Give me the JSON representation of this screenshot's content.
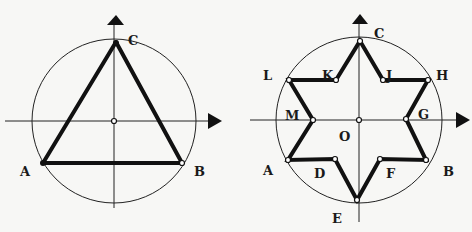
{
  "figures": [
    {
      "name": "triangle-in-circle",
      "center": {
        "x": 115,
        "y": 121
      },
      "radius": 82,
      "vertices": [
        {
          "label": "A",
          "x": 43,
          "y": 163,
          "lx": 20,
          "ly": 176
        },
        {
          "label": "B",
          "x": 182,
          "y": 163,
          "lx": 192,
          "ly": 176
        },
        {
          "label": "C",
          "x": 116,
          "y": 42,
          "lx": 128,
          "ly": 44
        }
      ],
      "axes": {
        "vertical": {
          "x": 114,
          "y1": 208,
          "y2": 22
        },
        "horizontal": {
          "y": 121,
          "x1": 5,
          "x2": 210
        }
      }
    },
    {
      "name": "hexagram-in-circle",
      "center": {
        "x": 359,
        "y": 120
      },
      "radius": 83,
      "center_label": {
        "label": "O",
        "lx": 339,
        "ly": 140
      },
      "vertices": [
        {
          "label": "C",
          "x": 360,
          "y": 41,
          "lx": 374,
          "ly": 39
        },
        {
          "label": "J",
          "x": 383,
          "y": 80,
          "lx": 386,
          "ly": 78
        },
        {
          "label": "H",
          "x": 428,
          "y": 80,
          "lx": 436,
          "ly": 79
        },
        {
          "label": "G",
          "x": 406,
          "y": 119,
          "lx": 418,
          "ly": 119
        },
        {
          "label": "B",
          "x": 426,
          "y": 160,
          "lx": 444,
          "ly": 176
        },
        {
          "label": "F",
          "x": 380,
          "y": 159,
          "lx": 386,
          "ly": 178
        },
        {
          "label": "E",
          "x": 357,
          "y": 200,
          "lx": 333,
          "ly": 223
        },
        {
          "label": "D",
          "x": 335,
          "y": 159,
          "lx": 314,
          "ly": 178
        },
        {
          "label": "A",
          "x": 288,
          "y": 160,
          "lx": 263,
          "ly": 175
        },
        {
          "label": "M",
          "x": 313,
          "y": 120,
          "lx": 286,
          "ly": 119
        },
        {
          "label": "L",
          "x": 289,
          "y": 80,
          "lx": 262,
          "ly": 79
        },
        {
          "label": "K",
          "x": 336,
          "y": 80,
          "lx": 321,
          "ly": 78
        }
      ],
      "axes": {
        "vertical": {
          "x": 359,
          "y1": 222,
          "y2": 20
        },
        "horizontal": {
          "y": 120,
          "x1": 250,
          "x2": 461
        }
      }
    }
  ]
}
